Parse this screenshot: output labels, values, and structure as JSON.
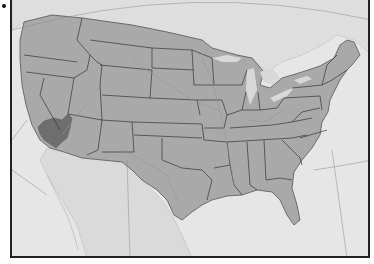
{
  "figure": {
    "marker": "bullet"
  },
  "map": {
    "colors": {
      "ocean": "#e6e6e6",
      "neighbor_land": "#dcdcdc",
      "us_land": "#a9a9a9",
      "highlight_region": "#6e6e6e",
      "state_border": "#333333",
      "rivers": "#939393",
      "lakes": "#d8d8d8",
      "frame": "#222222"
    },
    "highlighted_region": {
      "name": "Mojave Desert region",
      "location": "southern Nevada / southeastern California / northwestern Arizona"
    }
  }
}
